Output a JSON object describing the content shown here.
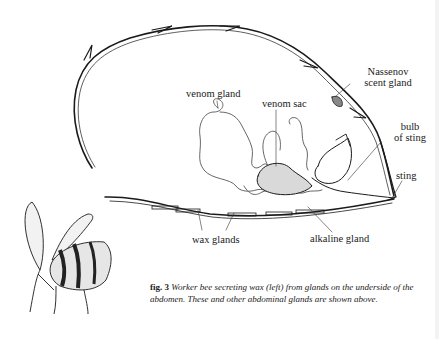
{
  "figure": {
    "number_label": "fig. 3",
    "caption": "Worker bee secreting wax (left) from glands on the underside of the abdomen. These and other abdominal glands are shown above."
  },
  "labels": {
    "nassenov_line1": "Nassenov",
    "nassenov_line2": "scent gland",
    "venom_gland": "venom gland",
    "venom_sac": "venom sac",
    "bulb_line1": "bulb",
    "bulb_line2": "of sting",
    "sting": "sting",
    "wax_glands": "wax glands",
    "alkaline_gland": "alkaline gland"
  },
  "illustrations": {
    "abdomen_cross_section": "bee-abdomen-cross-section",
    "worker_bee": "worker-bee-secreting-wax"
  },
  "colors": {
    "background": "#ffffff",
    "ink": "#1a1a1a",
    "gland_line": "#555555"
  }
}
